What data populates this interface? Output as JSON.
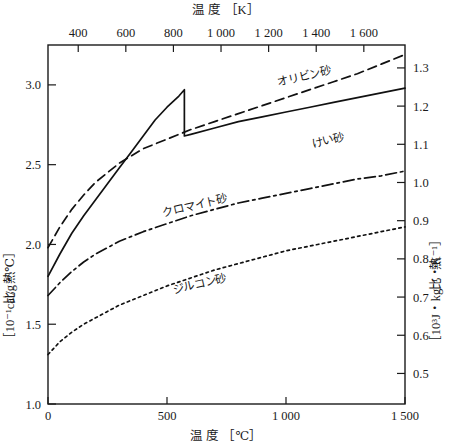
{
  "chart_data": {
    "type": "line",
    "title": "",
    "xlabel": "温 度 ［℃］",
    "xlabel_top": "温 度 ［K］",
    "ylabel": "比 熱 ［10⁻¹cal/g・℃］",
    "ylabel_right": "比 熱 ［10³J・kg⁻¹・K⁻¹］",
    "xlim": [
      0,
      1500
    ],
    "ylim": [
      1.0,
      3.25
    ],
    "xlim_top": [
      273,
      1773
    ],
    "ylim_right": [
      0.42,
      1.36
    ],
    "grid": false,
    "legend_position": "inline-annotations",
    "xticks": [
      0,
      500,
      1000,
      1500
    ],
    "xtick_labels": [
      "0",
      "500",
      "1 000",
      "1 500"
    ],
    "xticks_top": [
      400,
      600,
      800,
      1000,
      1200,
      1400,
      1600
    ],
    "xtick_labels_top": [
      "400",
      "600",
      "800",
      "1 000",
      "1 200",
      "1 400",
      "1 600"
    ],
    "yticks": [
      1.0,
      1.5,
      2.0,
      2.5,
      3.0
    ],
    "ytick_labels": [
      "1.0",
      "1.5",
      "2.0",
      "2.5",
      "3.0"
    ],
    "yticks_right": [
      0.5,
      0.6,
      0.7,
      0.8,
      0.9,
      1.0,
      1.1,
      1.2,
      1.3,
      1.4
    ],
    "ytick_labels_right": [
      "0.5",
      "0.6",
      "0.7",
      "0.8",
      "0.9",
      "1.0",
      "1.1",
      "1.2",
      "1.3",
      "1.4"
    ],
    "series": [
      {
        "name": "オリビン砂",
        "label": "オリビン砂",
        "style": "dashed",
        "label_x": 1080,
        "label_y": 3.03,
        "x": [
          0,
          50,
          100,
          150,
          200,
          250,
          300,
          400,
          500,
          600,
          700,
          800,
          900,
          1000,
          1100,
          1200,
          1300,
          1400,
          1500
        ],
        "y": [
          1.98,
          2.11,
          2.22,
          2.31,
          2.39,
          2.45,
          2.51,
          2.6,
          2.66,
          2.72,
          2.77,
          2.82,
          2.87,
          2.92,
          2.97,
          3.02,
          3.07,
          3.13,
          3.19
        ]
      },
      {
        "name": "けい砂",
        "label": "けい砂",
        "style": "solid",
        "label_x": 1180,
        "label_y": 2.63,
        "x": [
          0,
          50,
          100,
          150,
          200,
          250,
          300,
          350,
          400,
          450,
          500,
          550,
          573,
          573,
          600,
          700,
          800,
          900,
          1000,
          1100,
          1200,
          1300,
          1400,
          1500
        ],
        "y": [
          1.8,
          1.94,
          2.07,
          2.18,
          2.28,
          2.38,
          2.48,
          2.58,
          2.68,
          2.78,
          2.86,
          2.93,
          2.97,
          2.68,
          2.69,
          2.73,
          2.77,
          2.8,
          2.83,
          2.86,
          2.89,
          2.92,
          2.95,
          2.98
        ]
      },
      {
        "name": "クロマイト砂",
        "label": "クロマイト砂",
        "style": "dash-dot",
        "label_x": 620,
        "label_y": 2.22,
        "x": [
          0,
          50,
          100,
          150,
          200,
          300,
          400,
          500,
          600,
          700,
          800,
          900,
          1000,
          1100,
          1200,
          1300,
          1400,
          1500
        ],
        "y": [
          1.68,
          1.76,
          1.83,
          1.89,
          1.94,
          2.02,
          2.08,
          2.13,
          2.18,
          2.22,
          2.26,
          2.29,
          2.32,
          2.35,
          2.38,
          2.41,
          2.43,
          2.46
        ]
      },
      {
        "name": "ジルコン砂",
        "label": "ジルコン砂",
        "style": "dotted",
        "label_x": 640,
        "label_y": 1.73,
        "x": [
          0,
          50,
          100,
          150,
          200,
          300,
          400,
          500,
          600,
          700,
          800,
          900,
          1000,
          1100,
          1200,
          1300,
          1400,
          1500
        ],
        "y": [
          1.31,
          1.39,
          1.45,
          1.5,
          1.54,
          1.62,
          1.68,
          1.74,
          1.79,
          1.84,
          1.88,
          1.92,
          1.96,
          1.99,
          2.02,
          2.05,
          2.08,
          2.11
        ]
      }
    ]
  },
  "axes": {
    "top_title": "温 度 ［K］",
    "bottom_title": "温 度 ［℃］",
    "left_title_parts": [
      "比",
      "熱",
      "［10⁻¹cal/g・℃］"
    ],
    "right_title_parts": [
      "比",
      "熱",
      "［10³J・kg⁻¹・K⁻¹］"
    ]
  },
  "colors": {
    "ink": "#1a1a1a",
    "background": "#ffffff",
    "curve": "#111111"
  }
}
